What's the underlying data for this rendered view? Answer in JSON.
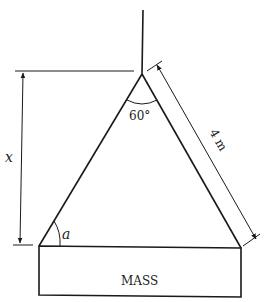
{
  "diagram": {
    "type": "mechanics-sling",
    "labels": {
      "height": "x",
      "apex_angle": "60°",
      "base_angle": "a",
      "sling_length": "4 m",
      "mass": "MASS"
    },
    "colors": {
      "line": "#1a1a1a",
      "background": "#ffffff"
    }
  }
}
